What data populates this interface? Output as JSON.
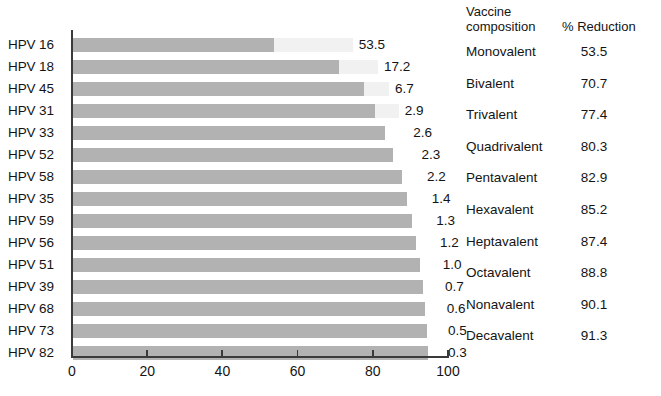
{
  "chart_data": {
    "type": "bar",
    "orientation": "horizontal",
    "title": "",
    "subtitle": "",
    "xlabel": "",
    "ylabel": "",
    "xlim": [
      0,
      100
    ],
    "xticks": [
      0,
      20,
      40,
      60,
      80,
      100
    ],
    "xtick_labels": [
      "0",
      "20",
      "40",
      "60",
      "80",
      "100"
    ],
    "grid": false,
    "legend": null,
    "note": "Bars are cumulative; the printed data label on each bar is that HPV type's individual percent contribution.",
    "categories": [
      "HPV 16",
      "HPV 18",
      "HPV 45",
      "HPV 31",
      "HPV 33",
      "HPV 52",
      "HPV 58",
      "HPV 35",
      "HPV 59",
      "HPV 56",
      "HPV 51",
      "HPV 39",
      "HPV 68",
      "HPV 73",
      "HPV 82"
    ],
    "values": [
      53.5,
      17.2,
      6.7,
      2.9,
      2.6,
      2.3,
      2.2,
      1.4,
      1.3,
      1.2,
      1.0,
      0.7,
      0.6,
      0.5,
      0.3
    ],
    "value_labels": [
      "53.5",
      "17.2",
      "6.7",
      "2.9",
      "2.6",
      "2.3",
      "2.2",
      "1.4",
      "1.3",
      "1.2",
      "1.0",
      "0.7",
      "0.6",
      "0.5",
      "0.3"
    ],
    "cumulative": [
      53.5,
      70.7,
      77.4,
      80.3,
      82.9,
      85.2,
      87.4,
      88.8,
      90.1,
      91.3,
      92.3,
      93.0,
      93.6,
      94.1,
      94.4
    ],
    "bar_color": "#b2b2b2",
    "ghost_color": "#f1f1f1",
    "axis_color": "#3a3a3a"
  },
  "table": {
    "headers": [
      "Vaccine composition",
      "% Reduction"
    ],
    "header_line1": "Vaccine",
    "header_line2": "composition",
    "header_col2": "% Reduction",
    "rows": [
      {
        "composition": "Monovalent",
        "reduction": "53.5"
      },
      {
        "composition": "Bivalent",
        "reduction": "70.7"
      },
      {
        "composition": "Trivalent",
        "reduction": "77.4"
      },
      {
        "composition": "Quadrivalent",
        "reduction": "80.3"
      },
      {
        "composition": "Pentavalent",
        "reduction": "82.9"
      },
      {
        "composition": "Hexavalent",
        "reduction": "85.2"
      },
      {
        "composition": "Heptavalent",
        "reduction": "87.4"
      },
      {
        "composition": "Octavalent",
        "reduction": "88.8"
      },
      {
        "composition": "Nonavalent",
        "reduction": "90.1"
      },
      {
        "composition": "Decavalent",
        "reduction": "91.3"
      }
    ]
  }
}
